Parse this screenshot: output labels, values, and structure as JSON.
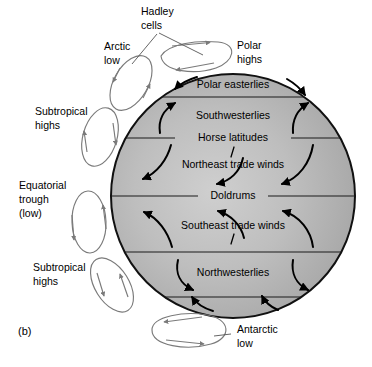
{
  "figure": {
    "panel_tag": "(b)",
    "colors": {
      "globe_fill_light": "#c9c9c9",
      "globe_fill_mid": "#b0b0b0",
      "globe_fill_dark": "#9b9b9b",
      "globe_outline": "#111111",
      "cell_stroke": "#7a7a7a",
      "wind_arrow": "#000000",
      "background": "#ffffff",
      "text": "#000000"
    },
    "globe": {
      "cx": 233,
      "cy": 196,
      "r": 122
    }
  },
  "external_labels": [
    {
      "id": "hadley-cells",
      "line1": "Hadley",
      "line2": "cells",
      "x": 141,
      "y": 12
    },
    {
      "id": "arctic-low",
      "line1": "Arctic",
      "line2": "low",
      "x": 104,
      "y": 47
    },
    {
      "id": "polar-highs",
      "line1": "Polar",
      "line2": "highs",
      "x": 237,
      "y": 46
    },
    {
      "id": "subtropical-highs-north",
      "line1": "Subtropical",
      "line2": "highs",
      "x": 35,
      "y": 112
    },
    {
      "id": "equatorial-trough",
      "line1": "Equatorial",
      "line2": "trough",
      "line3": "(low)",
      "x": 19,
      "y": 186
    },
    {
      "id": "subtropical-highs-south",
      "line1": "Subtropical",
      "line2": "highs",
      "x": 33,
      "y": 268
    },
    {
      "id": "antarctic-low",
      "line1": "Antarctic",
      "line2": "low",
      "x": 237,
      "y": 330
    }
  ],
  "wind_belts": [
    {
      "id": "polar-easterlies",
      "label": "Polar easterlies",
      "x": 233,
      "y": 85
    },
    {
      "id": "southwesterlies",
      "label": "Southwesterlies",
      "x": 233,
      "y": 116
    },
    {
      "id": "horse-latitudes",
      "label": "Horse latitudes",
      "x": 233,
      "y": 138
    },
    {
      "id": "northeast-trade-winds",
      "label": "Northeast trade winds",
      "x": 233,
      "y": 165
    },
    {
      "id": "doldrums",
      "label": "Doldrums",
      "x": 233,
      "y": 196
    },
    {
      "id": "southeast-trade-winds",
      "label": "Southeast trade winds",
      "x": 233,
      "y": 226
    },
    {
      "id": "northwesterlies",
      "label": "Northwesterlies",
      "x": 233,
      "y": 273
    }
  ]
}
